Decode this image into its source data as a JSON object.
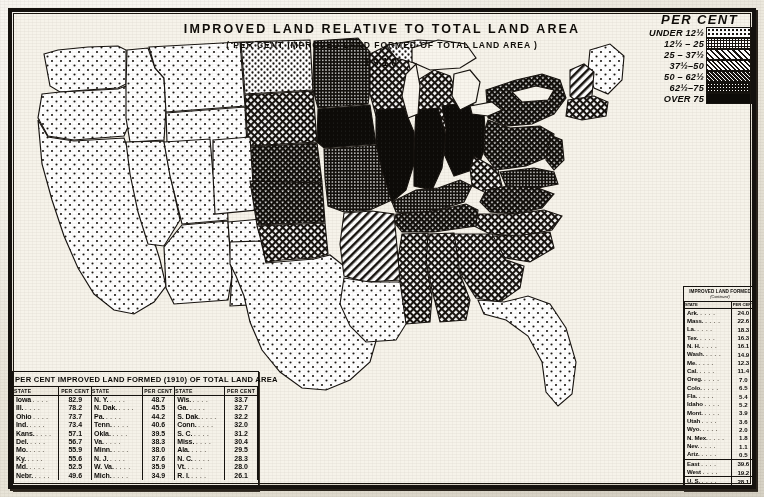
{
  "title": {
    "main": "IMPROVED LAND RELATIVE TO TOTAL LAND AREA",
    "sub": "( PER CENT IMPROVED LAND FORMED OF TOTAL LAND AREA )",
    "year": "1910"
  },
  "legend": {
    "heading": "PER CENT",
    "classes": [
      {
        "label": "UNDER 12½",
        "pattern": "dots-sparse",
        "color": "#ffffff"
      },
      {
        "label": "12½ – 25",
        "pattern": "dots-medium",
        "color": "#d8d8d8"
      },
      {
        "label": "25 – 37½",
        "pattern": "hatch-diagonal",
        "color": "#bdbdbd"
      },
      {
        "label": "37½–50",
        "pattern": "crosshatch-fine",
        "color": "#9a9a9a"
      },
      {
        "label": "50 – 62½",
        "pattern": "crosshatch-dense",
        "color": "#6e6e6e"
      },
      {
        "label": "62½–75",
        "pattern": "stipple-dark",
        "color": "#3c3c3c"
      },
      {
        "label": "OVER 75",
        "pattern": "solid-black",
        "color": "#111111"
      }
    ]
  },
  "table_bottom": {
    "caption": "PER CENT IMPROVED LAND FORMED (1910) OF TOTAL LAND AREA",
    "headers": [
      "STATE",
      "PER CENT",
      "STATE",
      "PER CENT",
      "STATE",
      "PER CENT"
    ],
    "rows": [
      [
        "Iowa",
        "82.9",
        "N. Y.",
        "48.7",
        "Wis.",
        "33.7"
      ],
      [
        "Ill.",
        "78.2",
        "N. Dak.",
        "45.5",
        "Ga.",
        "32.7"
      ],
      [
        "Ohio",
        "73.7",
        "Pa.",
        "44.2",
        "S. Dak.",
        "32.2"
      ],
      [
        "Ind.",
        "73.4",
        "Tenn.",
        "40.6",
        "Conn.",
        "32.0"
      ],
      [
        "Kans.",
        "57.1",
        "Okla.",
        "39.5",
        "S. C.",
        "31.2"
      ],
      [
        "Del.",
        "56.7",
        "Va.",
        "38.3",
        "Miss.",
        "30.4"
      ],
      [
        "Mo.",
        "55.9",
        "Minn.",
        "38.0",
        "Ala.",
        "29.5"
      ],
      [
        "Ky.",
        "55.6",
        "N. J.",
        "37.6",
        "N. C.",
        "28.3"
      ],
      [
        "Md.",
        "52.5",
        "W. Va.",
        "35.9",
        "Vt.",
        "28.0"
      ],
      [
        "Nebr.",
        "49.6",
        "Mich.",
        "34.9",
        "R. I.",
        "26.1"
      ]
    ]
  },
  "table_right": {
    "caption": "IMPROVED LAND FORMED",
    "caption_sub": "(Continued)",
    "headers": [
      "STATE",
      "PER CENT"
    ],
    "rows": [
      [
        "Ark.",
        "24.0"
      ],
      [
        "Mass.",
        "22.6"
      ],
      [
        "La.",
        "18.3"
      ],
      [
        "Tex.",
        "16.3"
      ],
      [
        "N. H.",
        "16.1"
      ],
      [
        "Wash.",
        "14.9"
      ],
      [
        "Me.",
        "12.3"
      ],
      [
        "Cal.",
        "11.4"
      ],
      [
        "Oreg.",
        "7.0"
      ],
      [
        "Colo.",
        "6.5"
      ],
      [
        "Fla.",
        "5.4"
      ],
      [
        "Idaho",
        "5.2"
      ],
      [
        "Mont.",
        "3.9"
      ],
      [
        "Utah",
        "3.6"
      ],
      [
        "Wyo.",
        "2.0"
      ],
      [
        "N. Mex.",
        "1.8"
      ],
      [
        "Nev.",
        "1.1"
      ],
      [
        "Ariz.",
        "0.5"
      ]
    ],
    "summary": [
      [
        "East",
        "39.6"
      ],
      [
        "West",
        "19.2"
      ]
    ],
    "total": [
      "U. S.",
      "28.1"
    ]
  }
}
